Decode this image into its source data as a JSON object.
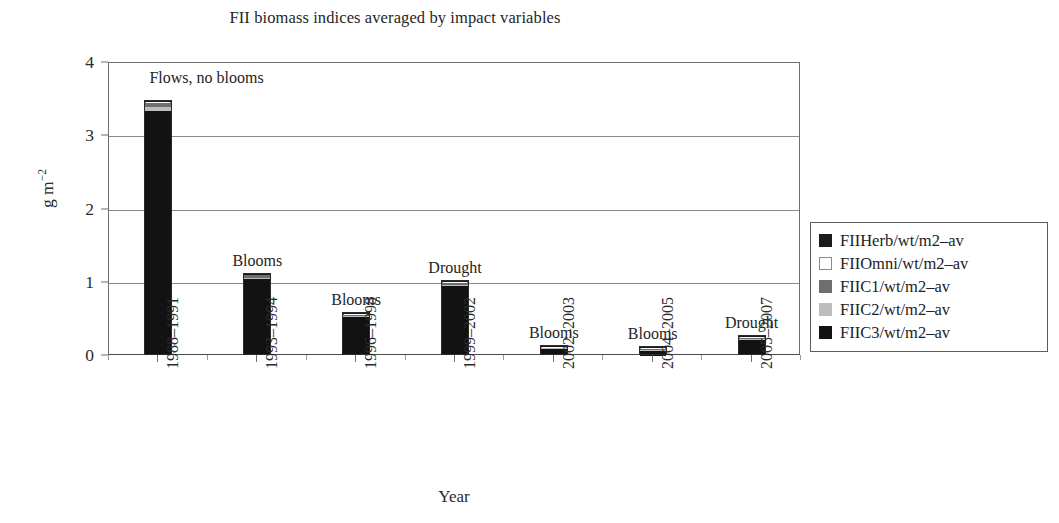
{
  "chart_data": {
    "type": "bar",
    "subtype": "stacked-column",
    "title": "FII biomass indices averaged by impact variables",
    "xlabel": "Year",
    "ylabel": "g m−2",
    "ylabel_base": "g m",
    "ylabel_exponent": "−2",
    "ylim": [
      0,
      4
    ],
    "yticks": [
      "0",
      "1",
      "2",
      "3",
      "4"
    ],
    "ytick_values": [
      0,
      1,
      2,
      3,
      4
    ],
    "grid": "horizontal",
    "legend_position": "right-outside",
    "categories": [
      "1988–1991",
      "1993–1994",
      "1996–1998",
      "1999–2002",
      "2002–2003",
      "2004–2005",
      "2005–2007"
    ],
    "annotations": [
      "Flows, no blooms",
      "Blooms",
      "Blooms",
      "Drought",
      "Blooms",
      "Blooms",
      "Drought"
    ],
    "series": [
      {
        "name": "FIIHerb/wt/m2–av",
        "color": "#1b1b1b",
        "values": [
          0.02,
          0.01,
          0.01,
          0.01,
          0.005,
          0.004,
          0.005
        ]
      },
      {
        "name": "FIIOmni/wt/m2–av",
        "color": "#ffffff",
        "values": [
          0.01,
          0.005,
          0.005,
          0.005,
          0.003,
          0.002,
          0.003
        ]
      },
      {
        "name": "FIIC1/wt/m2–av",
        "color": "#6e6e6e",
        "values": [
          0.06,
          0.03,
          0.02,
          0.03,
          0.012,
          0.009,
          0.02
        ]
      },
      {
        "name": "FIIC2/wt/m2–av",
        "color": "#bdbdbd",
        "values": [
          0.05,
          0.02,
          0.015,
          0.02,
          0.008,
          0.006,
          0.015
        ]
      },
      {
        "name": "FIIC3/wt/m2–av",
        "color": "#121212",
        "values": [
          3.32,
          1.03,
          0.51,
          0.93,
          0.082,
          0.069,
          0.2
        ]
      }
    ],
    "totals": [
      3.46,
      1.1,
      0.56,
      1.0,
      0.11,
      0.09,
      0.24
    ]
  },
  "legend": {
    "items": [
      {
        "label": "FIIHerb/wt/m2–av",
        "color": "#1b1b1b",
        "bordered": false
      },
      {
        "label": "FIIOmni/wt/m2–av",
        "color": "#ffffff",
        "bordered": true
      },
      {
        "label": "FIIC1/wt/m2–av",
        "color": "#6e6e6e",
        "bordered": false
      },
      {
        "label": "FIIC2/wt/m2–av",
        "color": "#bdbdbd",
        "bordered": false
      },
      {
        "label": "FIIC3/wt/m2–av",
        "color": "#121212",
        "bordered": false
      }
    ]
  },
  "colors": {
    "axis": "#6f6f6f",
    "grid": "#8a8a8a",
    "text": "#262626",
    "background": "#ffffff"
  }
}
